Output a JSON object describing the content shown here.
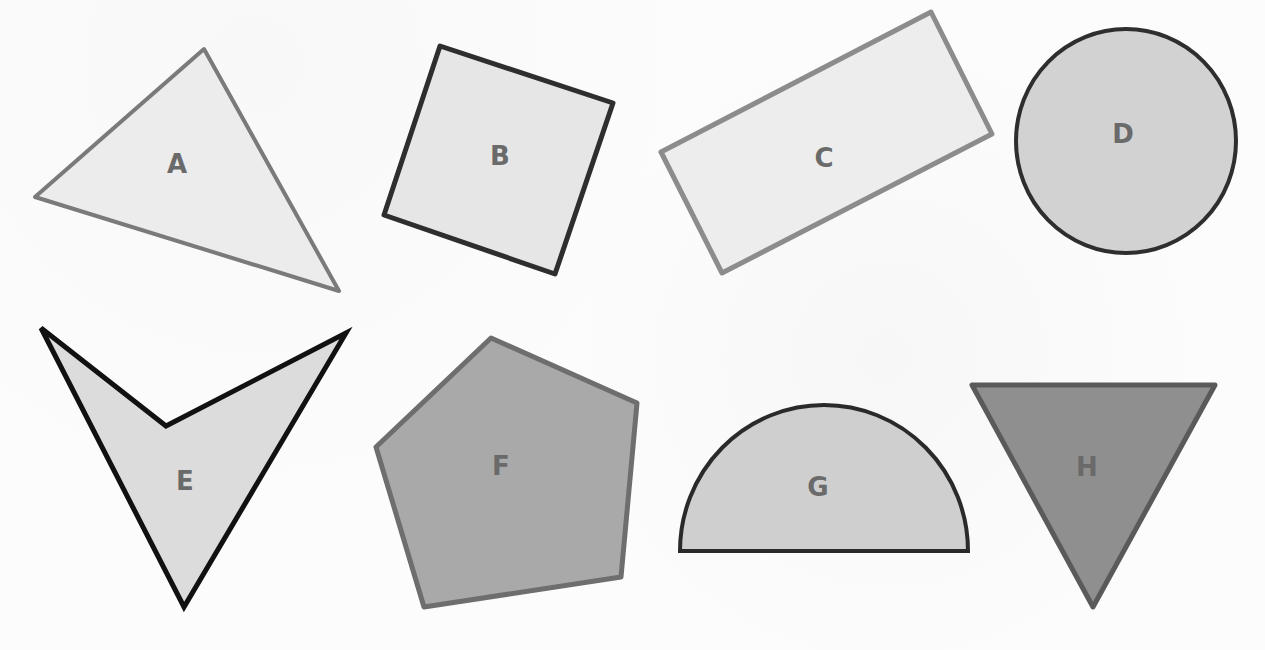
{
  "figure": {
    "shapes": [
      {
        "id": "A",
        "label": "A",
        "type": "scalene-triangle",
        "fill": "#ececec",
        "stroke": "#7a7a7a"
      },
      {
        "id": "B",
        "label": "B",
        "type": "square",
        "fill": "#e6e6e6",
        "stroke": "#2e2e2e"
      },
      {
        "id": "C",
        "label": "C",
        "type": "rectangle",
        "fill": "#ededed",
        "stroke": "#8c8c8c"
      },
      {
        "id": "D",
        "label": "D",
        "type": "circle",
        "fill": "#d2d2d2",
        "stroke": "#2e2e2e"
      },
      {
        "id": "E",
        "label": "E",
        "type": "concave-quadrilateral",
        "fill": "#dcdcdc",
        "stroke": "#111111"
      },
      {
        "id": "F",
        "label": "F",
        "type": "pentagon",
        "fill": "#a9a9a9",
        "stroke": "#6e6e6e"
      },
      {
        "id": "G",
        "label": "G",
        "type": "semicircle",
        "fill": "#cfcfcf",
        "stroke": "#2a2a2a"
      },
      {
        "id": "H",
        "label": "H",
        "type": "inverted-triangle",
        "fill": "#8f8f8f",
        "stroke": "#5a5a5a"
      }
    ]
  }
}
